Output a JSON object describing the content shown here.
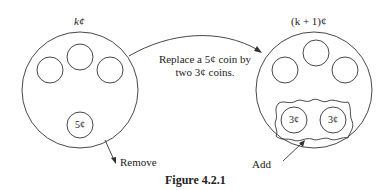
{
  "figure": {
    "caption": "Figure 4.2.1",
    "left": {
      "title": "k¢",
      "coins": [
        "",
        "",
        ""
      ],
      "removed_coin_label": "5¢",
      "remove_label": "Remove"
    },
    "right": {
      "title": "(k + 1)¢",
      "coins": [
        "",
        "",
        ""
      ],
      "added_coins": [
        "3¢",
        "3¢"
      ],
      "add_label": "Add"
    },
    "arrow_label_line1": "Replace a 5¢ coin by",
    "arrow_label_line2": "two 3¢ coins."
  }
}
